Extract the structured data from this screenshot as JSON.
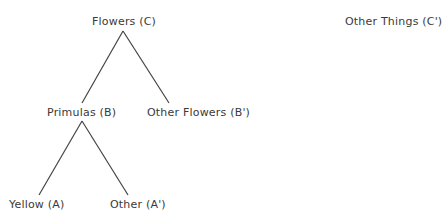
{
  "diagram": {
    "type": "tree",
    "nodes": {
      "root": "Flowers (C)",
      "complement_root": "Other Things (C')",
      "primulas": "Primulas (B)",
      "other_flowers": "Other Flowers (B')",
      "yellow": "Yellow (A)",
      "other": "Other (A')"
    },
    "edges": [
      [
        "Flowers (C)",
        "Primulas (B)"
      ],
      [
        "Flowers (C)",
        "Other Flowers (B')"
      ],
      [
        "Primulas (B)",
        "Yellow (A)"
      ],
      [
        "Primulas (B)",
        "Other (A')"
      ]
    ]
  }
}
